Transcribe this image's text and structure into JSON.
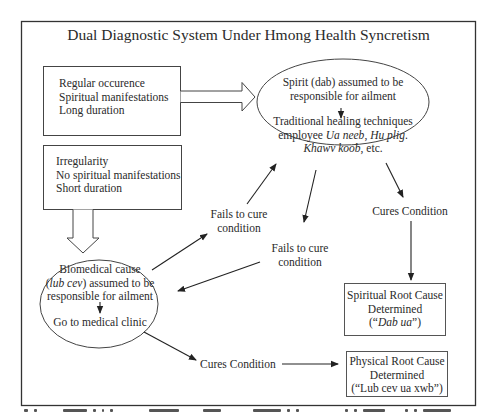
{
  "diagram": {
    "title": "Dual Diagnostic System Under Hmong Health Syncretism",
    "spiritual_indicators": {
      "lines": [
        "Regular occurence",
        "Spiritual manifestations",
        "Long duration"
      ]
    },
    "biomedical_indicators": {
      "lines": [
        "Irregularity",
        "No spiritual manifestations",
        "Short duration"
      ]
    },
    "spirit_node": {
      "line1": "Spirit (dab) assumed to be",
      "line2": "responsible for ailment",
      "line3": "Traditional healing techniques",
      "line4_prefix": "employee ",
      "line4_italic1": "Ua neeb",
      "line4_sep": ", ",
      "line4_italic2": "Hu plig",
      "line4_end": ".",
      "line5_italic": "Khawv koob",
      "line5_end": ", etc."
    },
    "biomedical_node": {
      "line1": "Biomedical cause",
      "line2_open": "(",
      "line2_italic": "lub cev",
      "line2_rest": ") assumed to be",
      "line3": "responsible for ailment",
      "line4": "Go to medical clinic"
    },
    "edges": {
      "fails_to_cure_1": [
        "Fails to cure",
        "condition"
      ],
      "fails_to_cure_2": [
        "Fails to cure",
        "condition"
      ],
      "cures_spiritual": "Cures Condition",
      "cures_physical": "Cures Condition"
    },
    "spiritual_root": {
      "line1": "Spiritual Root Cause",
      "line2": "Determined",
      "line3_open": "(“",
      "line3_italic": "Dab ua",
      "line3_close": "”)"
    },
    "physical_root": {
      "line1": "Physical Root Cause",
      "line2": "Determined",
      "line3": "(“Lub cev ua xwb”)"
    }
  },
  "colors": {
    "line": "#333333",
    "box_border": "#555555",
    "background": "#ffffff"
  }
}
